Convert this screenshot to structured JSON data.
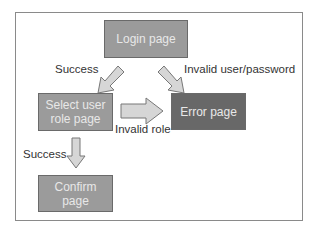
{
  "diagram": {
    "nodes": [
      {
        "id": "login",
        "label": "Login page"
      },
      {
        "id": "select-role",
        "label": "Select user role page"
      },
      {
        "id": "error",
        "label": "Error page"
      },
      {
        "id": "confirm",
        "label": "Confirm page"
      }
    ],
    "edges": [
      {
        "from": "login",
        "to": "select-role",
        "label": "Success"
      },
      {
        "from": "login",
        "to": "error",
        "label": "Invalid user/password"
      },
      {
        "from": "select-role",
        "to": "error",
        "label": "Invalid role"
      },
      {
        "from": "select-role",
        "to": "confirm",
        "label": "Success"
      }
    ],
    "colors": {
      "node_light": "#9b9b9b",
      "node_dark": "#686868",
      "arrow_fill": "#d6d6d6",
      "arrow_stroke": "#777777"
    }
  }
}
